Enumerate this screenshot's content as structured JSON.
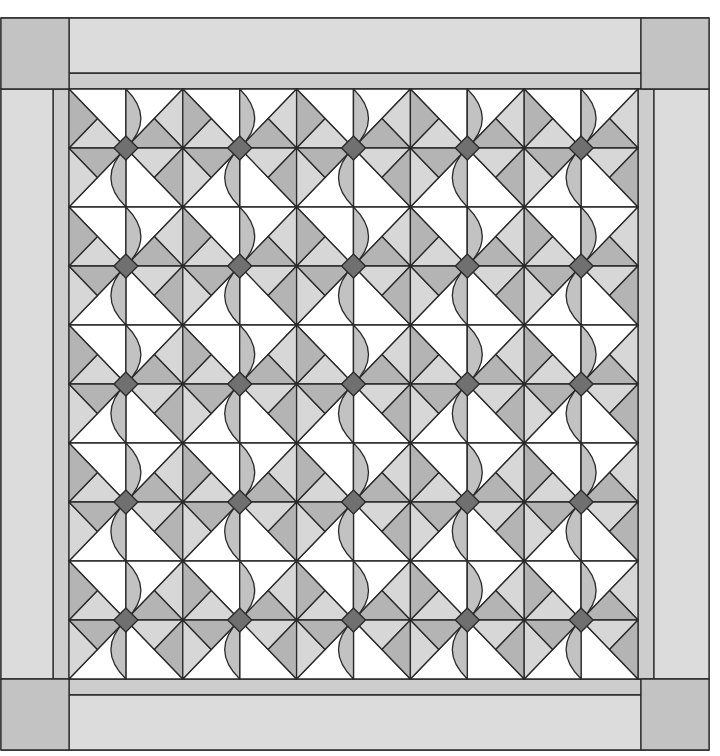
{
  "canvas": {
    "width": 720,
    "height": 756
  },
  "colors": {
    "background": "#ffffff",
    "outer_border": "#dcdcdc",
    "corner_square": "#c3c3c3",
    "inner_strip": "#cdcdcd",
    "white_patch": "#ffffff",
    "light_triangle": "#d7d7d7",
    "medium_triangle": "#b4b4b4",
    "petal": "#c2c2c2",
    "diamond": "#707070",
    "line": "#2a2a2a"
  },
  "outer": {
    "x0": 1,
    "y0": 18,
    "x1": 709,
    "y1": 750
  },
  "corner_size": {
    "w": 68,
    "h": 71
  },
  "inner_strip_width": 16,
  "grid": {
    "x0": 69,
    "y0": 89,
    "x1": 638,
    "y1": 679,
    "cols": 10,
    "rows": 10
  },
  "block": {
    "description": "2x2 cells around a junction; flowers sit at alternating grid points",
    "cells": {
      "NW": {
        "white": [
          "TL",
          "BR",
          "BL"
        ],
        "light": [
          "TL",
          "TR",
          "M"
        ],
        "medium": [
          "TR",
          "BR",
          "M"
        ]
      },
      "NE": {
        "white": [
          "BL",
          "TR",
          "BR"
        ],
        "light": [
          "TL",
          "BL",
          "M"
        ],
        "medium": [
          "TL",
          "TR",
          "M"
        ]
      },
      "SW": {
        "white": [
          "TL",
          "TR",
          "BL"
        ],
        "light": [
          "TR",
          "BR",
          "M"
        ],
        "medium": [
          "BL",
          "BR",
          "M"
        ]
      },
      "SE": {
        "white": [
          "TL",
          "TR",
          "BR"
        ],
        "light": [
          "BL",
          "BR",
          "M"
        ],
        "medium": [
          "TL",
          "BL",
          "M"
        ]
      }
    }
  },
  "flowers": {
    "count_x": 5,
    "count_y": 5,
    "diamond_half": 12,
    "petal_bulge": 15
  }
}
